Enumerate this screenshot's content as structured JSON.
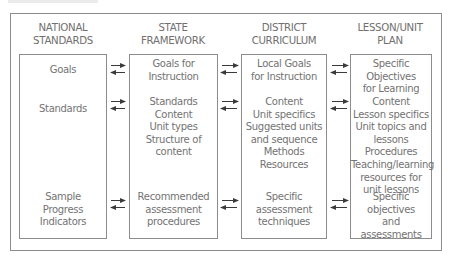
{
  "columns": [
    {
      "header": [
        "NATIONAL",
        "STANDARDS"
      ],
      "rows": {
        "goals": [
          "Goals"
        ],
        "content": [
          "Standards"
        ],
        "assessment": [
          "Sample",
          "Progress",
          "Indicators"
        ]
      }
    },
    {
      "header": [
        "STATE",
        "FRAMEWORK"
      ],
      "rows": {
        "goals": [
          "Goals for",
          "Instruction"
        ],
        "content": [
          "Standards",
          "Content",
          "Unit types",
          "Structure of",
          "content"
        ],
        "assessment": [
          "Recommended",
          "assessment",
          "procedures"
        ]
      }
    },
    {
      "header": [
        "DISTRICT",
        "CURRICULUM"
      ],
      "rows": {
        "goals": [
          "Local Goals",
          "for Instruction"
        ],
        "content": [
          "Content",
          "Unit specifics",
          "Suggested units",
          "and sequence",
          "Methods",
          "Resources"
        ],
        "assessment": [
          "Specific",
          "assessment",
          "techniques"
        ]
      }
    },
    {
      "header": [
        "LESSON/UNIT",
        "PLAN"
      ],
      "rows": {
        "goals": [
          "Specific Objectives",
          "for Learning"
        ],
        "content": [
          "Content",
          "Lesson specifics",
          "Unit topics and",
          "lessons",
          "Procedures",
          "Teaching/learning",
          "resources for",
          "unit lessons"
        ],
        "assessment": [
          "Specific",
          "objectives",
          "and assessments"
        ]
      }
    }
  ],
  "connections": [
    {
      "from": "NATIONAL STANDARDS",
      "to": "STATE FRAMEWORK",
      "rows": [
        "goals",
        "content",
        "assessment"
      ],
      "direction": "bidirectional"
    },
    {
      "from": "STATE FRAMEWORK",
      "to": "DISTRICT CURRICULUM",
      "rows": [
        "goals",
        "content",
        "assessment"
      ],
      "direction": "bidirectional"
    },
    {
      "from": "DISTRICT CURRICULUM",
      "to": "LESSON/UNIT PLAN",
      "rows": [
        "goals",
        "content",
        "assessment"
      ],
      "direction": "bidirectional"
    }
  ],
  "colors": {
    "line": "#8c8c8c",
    "text": "#737373",
    "arrow": "#3a3a3a"
  }
}
